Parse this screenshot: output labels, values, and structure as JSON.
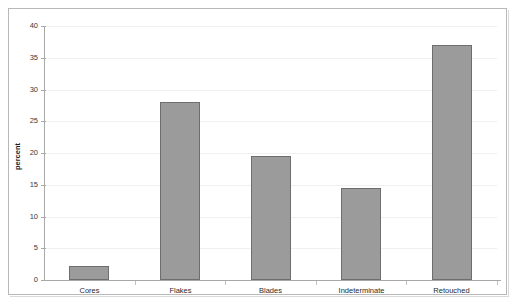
{
  "chart_data": {
    "type": "bar",
    "title": "",
    "xlabel": "",
    "ylabel": "percent",
    "categories": [
      "Cores",
      "Flakes",
      "Blades",
      "Indeterminate",
      "Retouched"
    ],
    "values": [
      2.2,
      28.0,
      19.5,
      14.5,
      37.0
    ],
    "ylim": [
      0,
      40
    ],
    "ytick_labels": [
      "0",
      "5",
      "10",
      "15",
      "20",
      "25",
      "30",
      "35",
      "40"
    ],
    "ytick_values": [
      0,
      5,
      10,
      15,
      20,
      25,
      30,
      35,
      40
    ],
    "grid": "horizontal",
    "legend": "none",
    "series": [
      {
        "name": "percent",
        "values": [
          2.2,
          28.0,
          19.5,
          14.5,
          37.0
        ]
      }
    ]
  },
  "style": {
    "bar_fill": "#9b9b9b",
    "bar_border": "#6e6e6e",
    "gridline_color": "#f0f0f0",
    "axis_color": "#a8a8a8",
    "frame_color": "#b8b8b8",
    "background": "#ffffff",
    "text_color": "#2a2a2a"
  }
}
